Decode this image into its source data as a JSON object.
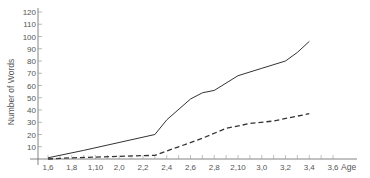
{
  "chart_data": {
    "type": "line",
    "title": "",
    "xlabel": "Age",
    "ylabel": "Number of Words",
    "x_tick_labels": [
      "1,6",
      "1,8",
      "1,10",
      "2,0",
      "2,2",
      "2,4",
      "2,6",
      "2,8",
      "2,10",
      "3,0",
      "3,2",
      "3,4",
      "3,6"
    ],
    "x_unit": "years,months",
    "y_ticks": [
      10,
      20,
      30,
      40,
      50,
      60,
      70,
      80,
      90,
      100,
      110,
      120
    ],
    "ylim": [
      0,
      120
    ],
    "grid": false,
    "legend": null,
    "series": [
      {
        "name": "solid",
        "style": "solid",
        "x": [
          "1,6",
          "1,9",
          "2,3",
          "2,4",
          "2,6",
          "2,7",
          "2,8",
          "2,10",
          "3,0",
          "3,2",
          "3,3",
          "3,4"
        ],
        "values": [
          1,
          7,
          20,
          32,
          49,
          54,
          56,
          68,
          74,
          80,
          87,
          96
        ]
      },
      {
        "name": "dashed",
        "style": "dashed",
        "x": [
          "1,6",
          "1,8",
          "2,3",
          "2,5",
          "2,7",
          "2,9",
          "2,11",
          "3,1",
          "3,3",
          "3,4"
        ],
        "values": [
          0,
          1,
          3,
          10,
          17,
          25,
          29,
          31,
          35,
          37
        ]
      }
    ]
  },
  "labels": {
    "ylabel": "Number of Words",
    "xlabel": "Age"
  }
}
